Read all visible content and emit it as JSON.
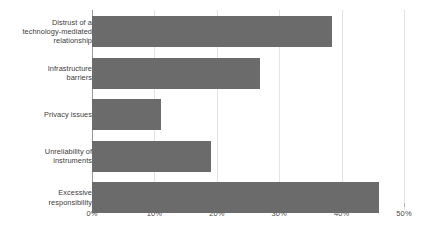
{
  "chart_data": {
    "type": "bar",
    "orientation": "horizontal",
    "title": "",
    "subtitle": "",
    "xlabel": "",
    "ylabel": "",
    "categories": [
      "Distrust of a technology-mediated relationship",
      "Infrastructure barriers",
      "Privacy issues",
      "Unreliability of instruments",
      "Excessive responsibility"
    ],
    "values": [
      38.5,
      27.0,
      11.0,
      19.0,
      46.0
    ],
    "xlim": [
      0,
      50
    ],
    "ylim": null,
    "xtick_labels": [
      "0%",
      "10%",
      "20%",
      "30%",
      "40%",
      "50%"
    ],
    "xtick_values": [
      0,
      10,
      20,
      30,
      40,
      50
    ],
    "grid": "vertical",
    "legend": null,
    "legend_position": "none",
    "bar_color": "#6b6b6b",
    "gridline_color": "#e3e3e3",
    "axis_color": "#9a9a9a",
    "label_color": "#3d3d3d",
    "background_color": "#ffffff"
  },
  "labels": {
    "bar_0_line_0": "Distrust of a",
    "bar_0_line_1": "technology-mediated",
    "bar_0_line_2": "relationship",
    "bar_1_line_0": "Infrastructure",
    "bar_1_line_1": "barriers",
    "bar_2_line_0": "Privacy issues",
    "bar_3_line_0": "Unreliability of",
    "bar_3_line_1": "instruments",
    "bar_4_line_0": "Excessive",
    "bar_4_line_1": "responsibility"
  }
}
